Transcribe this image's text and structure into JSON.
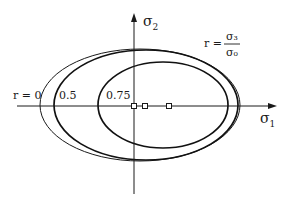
{
  "diagram": {
    "type": "yield-surface-ellipses",
    "axes": {
      "x": {
        "symbol": "σ",
        "subscript": "1"
      },
      "y": {
        "symbol": "σ",
        "subscript": "2"
      }
    },
    "parameter_definition": {
      "lhs": "r =",
      "numerator": "σ₃",
      "denominator": "σ₀"
    },
    "curves": [
      {
        "label": "r = 0",
        "weight": "thin",
        "cx": 140,
        "cy": 105,
        "rx": 100,
        "ry": 56
      },
      {
        "label": "0.5",
        "weight": "bold",
        "cx": 146,
        "cy": 105,
        "rx": 92,
        "ry": 55
      },
      {
        "label": "0.75",
        "weight": "bold",
        "cx": 163,
        "cy": 105,
        "rx": 65,
        "ry": 43
      }
    ],
    "center_markers": [
      {
        "name": "center-r-0",
        "x": 134,
        "y": 106
      },
      {
        "name": "center-r-0.5",
        "x": 145,
        "y": 106
      },
      {
        "name": "center-r-0.75",
        "x": 169,
        "y": 106
      }
    ],
    "colors": {
      "ink": "#1a1a1a",
      "background": "#ffffff"
    }
  }
}
